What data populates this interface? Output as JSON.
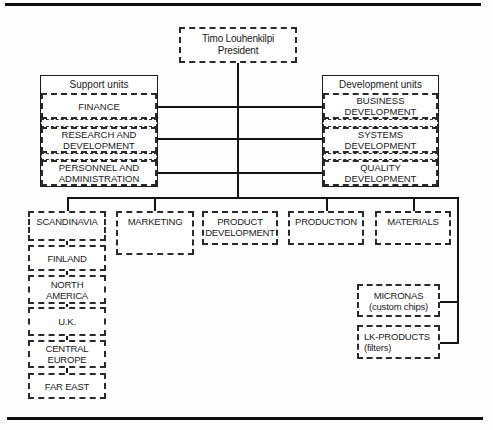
{
  "president": {
    "line1": "Timo Louhenkilpi",
    "line2": "President"
  },
  "support_units": {
    "header": "Support units",
    "items": [
      {
        "line1": "FINANCE",
        "line2": ""
      },
      {
        "line1": "RESEARCH AND",
        "line2": "DEVELOPMENT"
      },
      {
        "line1": "PERSONNEL AND",
        "line2": "ADMINISTRATION"
      }
    ]
  },
  "development_units": {
    "header": "Development units",
    "items": [
      {
        "line1": "BUSINESS",
        "line2": "DEVELOPMENT"
      },
      {
        "line1": "SYSTEMS",
        "line2": "DEVELOPMENT"
      },
      {
        "line1": "QUALITY",
        "line2": "DEVELOPMENT"
      }
    ]
  },
  "divisions": [
    {
      "line1": "SCANDINAVIA",
      "line2": ""
    },
    {
      "line1": "MARKETING",
      "line2": ""
    },
    {
      "line1": "PRODUCT",
      "line2": "DEVELOPMENT"
    },
    {
      "line1": "PRODUCTION",
      "line2": ""
    },
    {
      "line1": "MATERIALS",
      "line2": ""
    }
  ],
  "regions": [
    {
      "line1": "FINLAND",
      "line2": ""
    },
    {
      "line1": "NORTH",
      "line2": "AMERICA"
    },
    {
      "line1": "U.K.",
      "line2": ""
    },
    {
      "line1": "CENTRAL",
      "line2": "EUROPE"
    },
    {
      "line1": "FAR EAST",
      "line2": ""
    }
  ],
  "subsidiaries": [
    {
      "line1": "MICRONAS",
      "line2": "(custom chips)"
    },
    {
      "line1": "LK-PRODUCTS",
      "line2": "(filters)"
    }
  ]
}
